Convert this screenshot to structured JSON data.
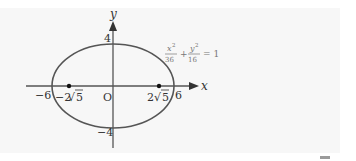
{
  "figure": {
    "type": "ellipse-diagram",
    "equation": {
      "x_term_num": "x",
      "x_term_exp": "2",
      "x_term_den": "36",
      "plus": "+",
      "y_term_num": "y",
      "y_term_exp": "2",
      "y_term_den": "16",
      "equals": "= 1"
    },
    "axes": {
      "x_label": "x",
      "y_label": "y",
      "origin_label": "O"
    },
    "ticks": {
      "y_top": "4",
      "y_bottom": "−4",
      "x_left": "−6",
      "x_right": "6",
      "focus_left_coef": "−2",
      "focus_right_coef": "2",
      "focus_radicand": "5"
    },
    "ellipse": {
      "a": 6,
      "b": 4,
      "c_expr": "2√5"
    },
    "foci": [
      {
        "x": "−2√5",
        "y": "0"
      },
      {
        "x": "2√5",
        "y": "0"
      }
    ],
    "colors": {
      "curve": "#555555",
      "axis": "#555555",
      "text": "#333333",
      "equation": "#777777"
    }
  }
}
